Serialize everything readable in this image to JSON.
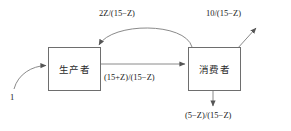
{
  "diagram": {
    "type": "flow-diagram",
    "background_color": "#ffffff",
    "line_color": "#6e6e6e",
    "text_color": "#1a1a1a",
    "nodes": [
      {
        "id": "producer",
        "label": "生产者"
      },
      {
        "id": "consumer",
        "label": "消费者"
      }
    ],
    "edges": [
      {
        "id": "input",
        "label": "1",
        "from": "external",
        "to": "producer",
        "style": "curved",
        "direction": "right"
      },
      {
        "id": "flow",
        "label": "(15+Z)/(15−Z)",
        "from": "producer",
        "to": "consumer",
        "style": "straight",
        "direction": "right"
      },
      {
        "id": "recycle",
        "label": "2Z/(15−Z)",
        "from": "consumer",
        "to": "producer",
        "style": "arc",
        "direction": "left"
      },
      {
        "id": "output",
        "label": "10/(15−Z)",
        "from": "consumer",
        "to": "external",
        "style": "diagonal",
        "direction": "up-right"
      },
      {
        "id": "loss",
        "label": "(5−Z)/(15−Z)",
        "from": "consumer",
        "to": "external",
        "style": "straight",
        "direction": "down"
      }
    ]
  }
}
